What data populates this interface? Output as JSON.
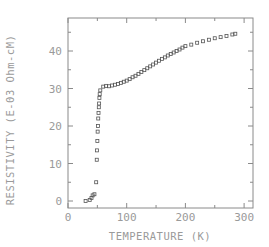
{
  "chart_data": {
    "type": "scatter",
    "title": "",
    "xlabel": "TEMPERATURE (K)",
    "ylabel": "RESISTIVITY (E-03 Ohm-cM)",
    "xlim": [
      0,
      315
    ],
    "ylim": [
      -2,
      47
    ],
    "xticks": [
      0,
      100,
      200,
      300
    ],
    "xtick_labels": [
      "0",
      "100",
      "200",
      "300"
    ],
    "yticks": [
      0,
      10,
      20,
      30,
      40
    ],
    "ytick_labels": [
      "0",
      "10",
      "20",
      "30",
      "40"
    ],
    "grid": false,
    "legend": "none",
    "marker": "open-square",
    "series": [
      {
        "name": "resistivity",
        "points": [
          [
            30,
            0.0
          ],
          [
            37,
            0.3
          ],
          [
            40,
            0.8
          ],
          [
            42,
            1.5
          ],
          [
            45,
            1.8
          ],
          [
            48,
            5.0
          ],
          [
            49,
            11.0
          ],
          [
            49.5,
            13.5
          ],
          [
            50,
            16.0
          ],
          [
            50.5,
            18.5
          ],
          [
            51,
            20.0
          ],
          [
            51.5,
            22.0
          ],
          [
            52,
            23.5
          ],
          [
            52.5,
            25.0
          ],
          [
            53,
            26.0
          ],
          [
            53.5,
            27.5
          ],
          [
            54,
            28.5
          ],
          [
            55,
            29.5
          ],
          [
            60,
            30.5
          ],
          [
            65,
            30.7
          ],
          [
            70,
            30.6
          ],
          [
            75,
            30.8
          ],
          [
            80,
            31.0
          ],
          [
            85,
            31.2
          ],
          [
            90,
            31.5
          ],
          [
            95,
            31.8
          ],
          [
            100,
            32.1
          ],
          [
            105,
            32.5
          ],
          [
            110,
            33.0
          ],
          [
            115,
            33.4
          ],
          [
            120,
            33.9
          ],
          [
            125,
            34.4
          ],
          [
            130,
            34.9
          ],
          [
            135,
            35.4
          ],
          [
            140,
            35.9
          ],
          [
            145,
            36.4
          ],
          [
            150,
            36.9
          ],
          [
            155,
            37.4
          ],
          [
            160,
            37.9
          ],
          [
            165,
            38.3
          ],
          [
            170,
            38.8
          ],
          [
            175,
            39.2
          ],
          [
            180,
            39.6
          ],
          [
            185,
            40.0
          ],
          [
            190,
            40.4
          ],
          [
            195,
            40.9
          ],
          [
            200,
            41.3
          ],
          [
            210,
            41.7
          ],
          [
            220,
            42.2
          ],
          [
            230,
            42.6
          ],
          [
            240,
            43.0
          ],
          [
            250,
            43.4
          ],
          [
            260,
            43.7
          ],
          [
            270,
            44.0
          ],
          [
            280,
            44.4
          ],
          [
            285,
            44.6
          ]
        ]
      }
    ]
  }
}
